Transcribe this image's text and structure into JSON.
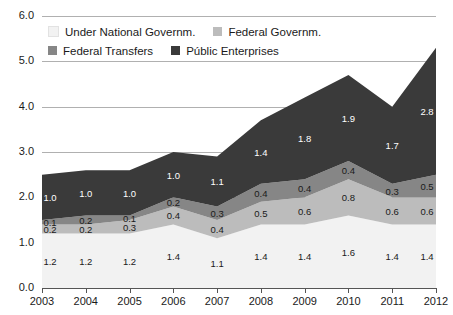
{
  "chart_data": {
    "type": "area",
    "stacked": true,
    "title": "",
    "xlabel": "",
    "ylabel": "",
    "categories": [
      "2003",
      "2004",
      "2005",
      "2006",
      "2007",
      "2008",
      "2009",
      "2010",
      "2011",
      "2012"
    ],
    "ylim": [
      0.0,
      6.0
    ],
    "yticks": [
      "0.0",
      "1.0",
      "2.0",
      "3.0",
      "4.0",
      "5.0",
      "6.0"
    ],
    "ytick_values": [
      0.0,
      1.0,
      2.0,
      3.0,
      4.0,
      5.0,
      6.0
    ],
    "grid": true,
    "legend_position": "top",
    "series": [
      {
        "name": "Under National Governm.",
        "color": "#f2f2f2",
        "label_color": "dark",
        "values": [
          1.2,
          1.2,
          1.2,
          1.4,
          1.1,
          1.4,
          1.4,
          1.6,
          1.4,
          1.4
        ],
        "labels": [
          "1.2",
          "1.2",
          "1.2",
          "1.4",
          "1.1",
          "1.4",
          "1.4",
          "1.6",
          "1.4",
          "1.4"
        ]
      },
      {
        "name": "Federal Governm.",
        "color": "#bcbcbc",
        "label_color": "dark",
        "values": [
          0.2,
          0.2,
          0.3,
          0.4,
          0.4,
          0.5,
          0.6,
          0.8,
          0.6,
          0.6
        ],
        "labels": [
          "0.2",
          "0.2",
          "0.3",
          "0.4",
          "0.4",
          "0.5",
          "0.6",
          "0.8",
          "0.6",
          "0.6"
        ]
      },
      {
        "name": "Federal Transfers",
        "color": "#868686",
        "label_color": "dark",
        "values": [
          0.1,
          0.2,
          0.1,
          0.2,
          0.3,
          0.4,
          0.4,
          0.4,
          0.3,
          0.5
        ],
        "labels": [
          "0.1",
          "0.2",
          "0.1",
          "0.2",
          "0.3",
          "0.4",
          "0.4",
          "0.4",
          "0.3",
          "0.5"
        ]
      },
      {
        "name": "Públic Enterprises",
        "color": "#3a3a3a",
        "label_color": "light",
        "values": [
          1.0,
          1.0,
          1.0,
          1.0,
          1.1,
          1.4,
          1.8,
          1.9,
          1.7,
          2.8
        ],
        "labels": [
          "1.0",
          "1.0",
          "1.0",
          "1.0",
          "1.1",
          "1.4",
          "1.8",
          "1.9",
          "1.7",
          "2.8"
        ]
      }
    ]
  },
  "legend": {
    "items": [
      {
        "label": "Under National Governm.",
        "color": "#f2f2f2"
      },
      {
        "label": "Federal Governm.",
        "color": "#bcbcbc"
      },
      {
        "label": "Federal Transfers",
        "color": "#868686"
      },
      {
        "label": "Públic Enterprises",
        "color": "#3a3a3a"
      }
    ]
  }
}
